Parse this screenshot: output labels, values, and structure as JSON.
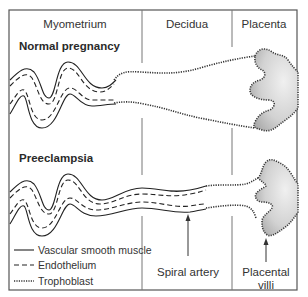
{
  "regions": {
    "myometrium": "Myometrium",
    "decidua": "Decidua",
    "placenta": "Placenta"
  },
  "conditions": {
    "normal": "Normal pregnancy",
    "preeclampsia": "Preeclampsia"
  },
  "legend": [
    {
      "style": "solid",
      "label": "Vascular smooth muscle"
    },
    {
      "style": "dashed",
      "label": "Endothelium"
    },
    {
      "style": "dotted",
      "label": "Trophoblast"
    }
  ],
  "callouts": {
    "spiral_artery": "Spiral artery",
    "placental_villi_line1": "Placental",
    "placental_villi_line2": "villi"
  },
  "colors": {
    "villi_fill_light": "#eeeeee",
    "villi_fill_dark": "#b8b8b8",
    "line": "#222222",
    "frame": "#555555"
  }
}
